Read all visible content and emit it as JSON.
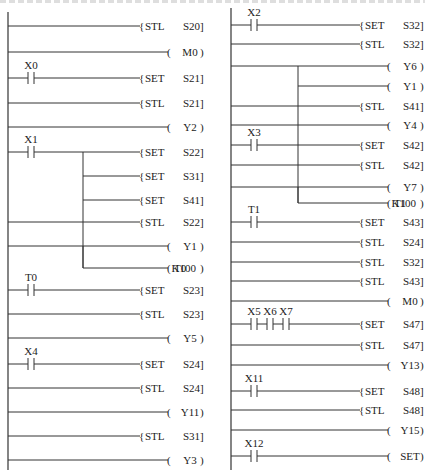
{
  "diagram": {
    "title": "",
    "type": "ladder",
    "columns": [
      {
        "name": "left",
        "rail_x": 8,
        "rail_top": 12,
        "rail_bottom": 470,
        "coil_x": 170,
        "bracket_end": 200,
        "rungs": [
          {
            "y": 26,
            "contacts": [],
            "kind": "instr",
            "op": "STL",
            "arg": "S20"
          },
          {
            "y": 52,
            "contacts": [],
            "kind": "coil",
            "op": "",
            "arg": "M0"
          },
          {
            "y": 78,
            "contacts": [
              "X0"
            ],
            "kind": "instr",
            "op": "SET",
            "arg": "S21"
          },
          {
            "y": 103,
            "contacts": [],
            "kind": "instr",
            "op": "STL",
            "arg": "S21"
          },
          {
            "y": 127,
            "contacts": [],
            "kind": "coil",
            "op": "",
            "arg": "Y2"
          },
          {
            "y": 152,
            "contacts": [
              "X1"
            ],
            "kind": "instr",
            "op": "SET",
            "arg": "S22",
            "branch_x": 83,
            "branch_to": 200
          },
          {
            "y": 176,
            "contacts": [],
            "kind": "instr",
            "op": "SET",
            "arg": "S31",
            "branch_from": 83
          },
          {
            "y": 200,
            "contacts": [],
            "kind": "instr",
            "op": "SET",
            "arg": "S41",
            "branch_from": 83
          },
          {
            "y": 222,
            "contacts": [],
            "kind": "instr",
            "op": "STL",
            "arg": "S22"
          },
          {
            "y": 246,
            "contacts": [],
            "kind": "coil",
            "op": "",
            "arg": "Y1",
            "branch_x": 83,
            "branch_to": 268
          },
          {
            "y": 268,
            "contacts": [],
            "kind": "coil",
            "op": "T0",
            "arg": "K100",
            "branch_from": 83
          },
          {
            "y": 290,
            "contacts": [
              "T0"
            ],
            "kind": "instr",
            "op": "SET",
            "arg": "S23"
          },
          {
            "y": 314,
            "contacts": [],
            "kind": "instr",
            "op": "STL",
            "arg": "S23"
          },
          {
            "y": 338,
            "contacts": [],
            "kind": "coil",
            "op": "",
            "arg": "Y5"
          },
          {
            "y": 364,
            "contacts": [
              "X4"
            ],
            "kind": "instr",
            "op": "SET",
            "arg": "S24"
          },
          {
            "y": 388,
            "contacts": [],
            "kind": "instr",
            "op": "STL",
            "arg": "S24"
          },
          {
            "y": 412,
            "contacts": [],
            "kind": "coil",
            "op": "",
            "arg": "Y11"
          },
          {
            "y": 436,
            "contacts": [],
            "kind": "instr",
            "op": "STL",
            "arg": "S31"
          },
          {
            "y": 460,
            "contacts": [],
            "kind": "coil",
            "op": "",
            "arg": "Y3"
          }
        ]
      },
      {
        "name": "right",
        "rail_x": 231,
        "rail_top": 8,
        "rail_bottom": 470,
        "coil_x": 390,
        "bracket_end": 420,
        "rungs": [
          {
            "y": 25,
            "contacts": [
              "X2"
            ],
            "kind": "instr",
            "op": "SET",
            "arg": "S32"
          },
          {
            "y": 44,
            "contacts": [],
            "kind": "instr",
            "op": "STL",
            "arg": "S32"
          },
          {
            "y": 66,
            "contacts": [],
            "kind": "coil",
            "op": "",
            "arg": "Y6",
            "branch_x": 298,
            "branch_to": 86
          },
          {
            "y": 86,
            "contacts": [],
            "kind": "coil",
            "op": "",
            "arg": "Y1",
            "branch_from": 298
          },
          {
            "y": 106,
            "contacts": [],
            "kind": "instr",
            "op": "STL",
            "arg": "S41"
          },
          {
            "y": 125,
            "contacts": [],
            "kind": "coil",
            "op": "",
            "arg": "Y4"
          },
          {
            "y": 145,
            "contacts": [
              "X3"
            ],
            "kind": "instr",
            "op": "SET",
            "arg": "S42"
          },
          {
            "y": 165,
            "contacts": [],
            "kind": "instr",
            "op": "STL",
            "arg": "S42"
          },
          {
            "y": 187,
            "contacts": [],
            "kind": "coil",
            "op": "",
            "arg": "Y7",
            "branch_x": 298,
            "branch_to": 203
          },
          {
            "y": 203,
            "contacts": [],
            "kind": "coil",
            "op": "T1",
            "arg": "K100",
            "branch_from": 298
          },
          {
            "y": 222,
            "contacts": [
              "T1"
            ],
            "kind": "instr",
            "op": "SET",
            "arg": "S43"
          },
          {
            "y": 242,
            "contacts": [],
            "kind": "instr",
            "op": "STL",
            "arg": "S24"
          },
          {
            "y": 262,
            "contacts": [],
            "kind": "instr",
            "op": "STL",
            "arg": "S32"
          },
          {
            "y": 281,
            "contacts": [],
            "kind": "instr",
            "op": "STL",
            "arg": "S43"
          },
          {
            "y": 301,
            "contacts": [],
            "kind": "coil",
            "op": "",
            "arg": "M0"
          },
          {
            "y": 324,
            "contacts": [
              "X5",
              "X6",
              "X7"
            ],
            "kind": "instr",
            "op": "SET",
            "arg": "S47"
          },
          {
            "y": 345,
            "contacts": [],
            "kind": "instr",
            "op": "STL",
            "arg": "S47"
          },
          {
            "y": 365,
            "contacts": [],
            "kind": "coil",
            "op": "",
            "arg": "Y13"
          },
          {
            "y": 391,
            "contacts": [
              "X11"
            ],
            "kind": "instr",
            "op": "SET",
            "arg": "S48"
          },
          {
            "y": 410,
            "contacts": [],
            "kind": "instr",
            "op": "STL",
            "arg": "S48"
          },
          {
            "y": 430,
            "contacts": [],
            "kind": "coil",
            "op": "",
            "arg": "Y15"
          },
          {
            "y": 456,
            "contacts": [
              "X12"
            ],
            "kind": "coil",
            "op": "",
            "arg": "SET"
          }
        ]
      }
    ]
  },
  "colors": {
    "line": "#333333",
    "text": "#222222",
    "background": "#ffffff"
  }
}
